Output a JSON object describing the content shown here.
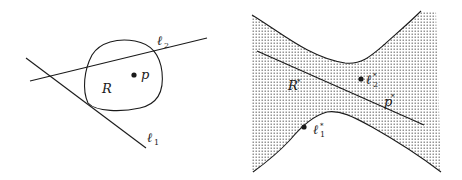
{
  "figure": {
    "primal": {
      "region_label": "R",
      "point_label": "p",
      "line1": {
        "name": "ℓ",
        "index": "1"
      },
      "line2": {
        "name": "ℓ",
        "index": "2"
      }
    },
    "dual": {
      "region_label": "R",
      "region_star": "*",
      "line_label": "p",
      "line_star": "*",
      "point1": {
        "name": "ℓ",
        "index": "1",
        "star": "*"
      },
      "point2": {
        "name": "ℓ",
        "index": "2",
        "star": "*"
      }
    },
    "colors": {
      "stroke": "#1a1a1a",
      "stipple": "#555555",
      "background": "#ffffff"
    }
  }
}
